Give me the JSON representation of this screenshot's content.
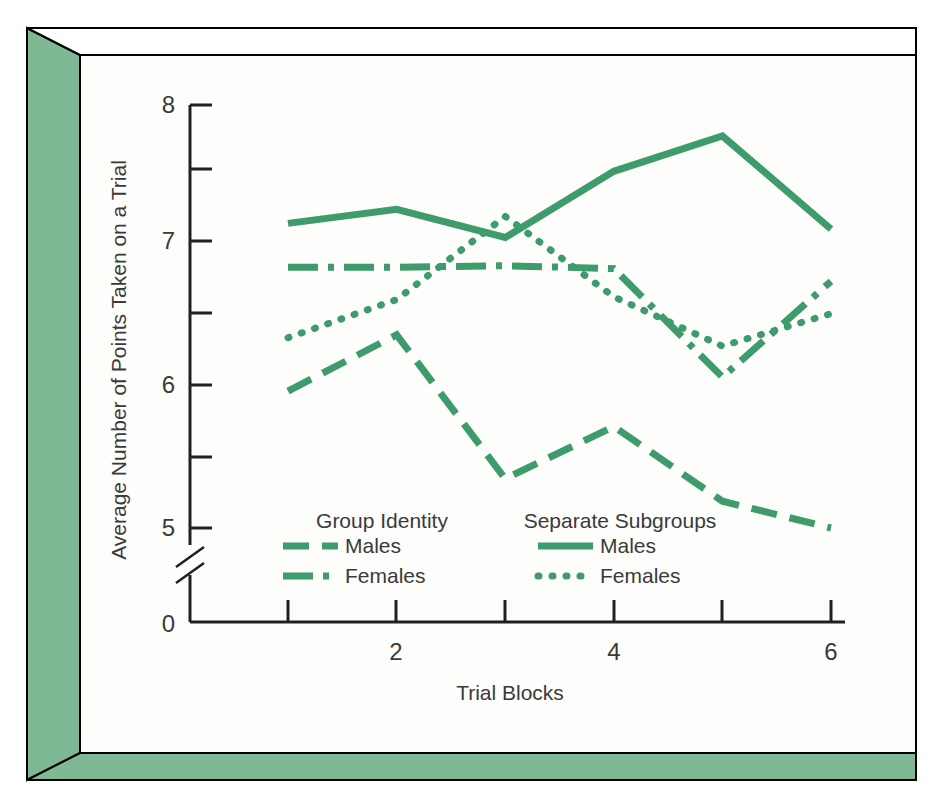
{
  "figure": {
    "frame_color": "#000000",
    "plate_color": "#7fb894",
    "page_background": "#ffffff",
    "plot_background": "#fdfdfb"
  },
  "chart_data": {
    "type": "line",
    "title": "",
    "xlabel": "Trial Blocks",
    "ylabel": "Average Number of Points Taken on a Trial",
    "x": [
      1,
      2,
      3,
      4,
      5,
      6
    ],
    "xtick_values": [
      1,
      2,
      3,
      4,
      5,
      6
    ],
    "xtick_labels": [
      "",
      "2",
      "",
      "4",
      "",
      "6"
    ],
    "xlim": [
      0.55,
      6.35
    ],
    "ytick_values": [
      0,
      5,
      5.5,
      6,
      6.5,
      7,
      7.5,
      8
    ],
    "ytick_labels": [
      "0",
      "5",
      "",
      "6",
      "",
      "7",
      "",
      "8"
    ],
    "ylim": [
      5.0,
      8.0
    ],
    "axis_break": true,
    "grid": false,
    "legend_position": "inside-lower-left",
    "line_color": "#3e9b6b",
    "series": [
      {
        "name": "Group Identity Males",
        "group": "Group Identity",
        "label": "Males",
        "dash": "dashed",
        "values": [
          5.97,
          6.37,
          5.35,
          5.72,
          5.19,
          5.0
        ]
      },
      {
        "name": "Group Identity Females",
        "group": "Group Identity",
        "label": "Females",
        "dash": "dash-dot",
        "values": [
          6.85,
          6.85,
          6.86,
          6.84,
          6.07,
          6.75
        ]
      },
      {
        "name": "Separate Subgroups Males",
        "group": "Separate Subgroups",
        "label": "Males",
        "dash": "solid",
        "values": [
          7.16,
          7.26,
          7.06,
          7.53,
          7.78,
          7.12
        ]
      },
      {
        "name": "Separate Subgroups Females",
        "group": "Separate Subgroups",
        "label": "Females",
        "dash": "dotted",
        "values": [
          6.35,
          6.62,
          7.21,
          6.64,
          6.29,
          6.52
        ]
      }
    ]
  },
  "legend": {
    "blocks": [
      {
        "heading": "Group Identity",
        "entries": [
          {
            "label": "Males",
            "dash": "dashed"
          },
          {
            "label": "Females",
            "dash": "dash-dot"
          }
        ]
      },
      {
        "heading": "Separate Subgroups",
        "entries": [
          {
            "label": "Males",
            "dash": "solid"
          },
          {
            "label": "Females",
            "dash": "dotted"
          }
        ]
      }
    ]
  }
}
